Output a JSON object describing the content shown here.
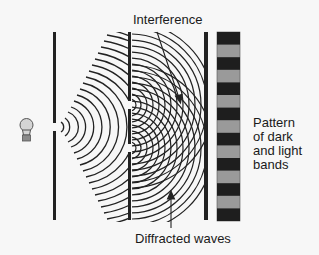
{
  "labels": {
    "interference": "Interference",
    "pattern": "Pattern\nof dark\nand light\nbands",
    "diffracted": "Diffracted waves"
  },
  "icons": {
    "light_source": "light-bulb-icon"
  },
  "colors": {
    "background": "#f7f7f7",
    "barrier": "#222222",
    "wave": "#222222",
    "dark_band": "#1e1e1e",
    "light_band": "#9a9a9a",
    "bulb_fill": "#d4d4d4",
    "bulb_base": "#8a8a8a"
  },
  "geometry": {
    "barrier_1": {
      "x": 55,
      "y_top": 32,
      "y_bottom": 220,
      "slits_y": [
        127
      ]
    },
    "barrier_2": {
      "x": 130,
      "y_top": 32,
      "y_bottom": 220,
      "slits_y": [
        105,
        148
      ]
    },
    "screen": {
      "x": 206,
      "y_top": 32,
      "y_bottom": 220
    },
    "band_pattern": {
      "x": 217,
      "width": 23,
      "y_top": 32,
      "y_bottom": 221,
      "band_count": 15,
      "starts_with": "dark"
    }
  }
}
